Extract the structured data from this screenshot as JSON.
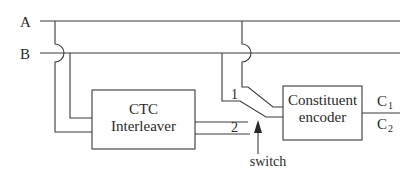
{
  "diagram": {
    "inputs": [
      {
        "id": "A",
        "label": "A"
      },
      {
        "id": "B",
        "label": "B"
      }
    ],
    "blocks": {
      "interleaver": {
        "line1": "CTC",
        "line2": "Interleaver"
      },
      "encoder": {
        "line1": "Constituent",
        "line2": "encoder"
      }
    },
    "switch": {
      "label": "switch",
      "positions": [
        {
          "id": "1",
          "label": "1"
        },
        {
          "id": "2",
          "label": "2"
        }
      ]
    },
    "outputs": [
      {
        "id": "C1",
        "label": "C",
        "subscript": "1"
      },
      {
        "id": "C2",
        "label": "C",
        "subscript": "2"
      }
    ],
    "colors": {
      "line": "#3a3a3a",
      "text": "#2a2a2a",
      "background": "#ffffff"
    }
  }
}
